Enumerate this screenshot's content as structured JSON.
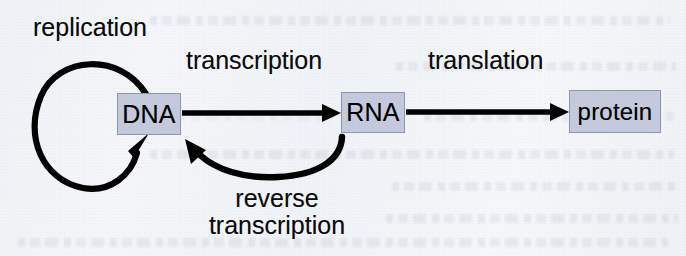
{
  "figure": {
    "background_color": "#f2f4f7",
    "node_fill_color": "#c4cadb",
    "node_border_color": "#8e96ad",
    "arrow_color": "#000000",
    "text_color": "#0a0a0a"
  },
  "nodes": [
    {
      "id": "dna",
      "label": "DNA"
    },
    {
      "id": "rna",
      "label": "RNA"
    },
    {
      "id": "protein",
      "label": "protein"
    }
  ],
  "labels": {
    "replication": "replication",
    "transcription": "transcription",
    "translation": "translation",
    "reverse_transcription_line1": "reverse",
    "reverse_transcription_line2": "transcription"
  },
  "edges": [
    {
      "id": "replication",
      "from": "DNA",
      "to": "DNA",
      "label": "replication",
      "shape": "loop-left-ellipse"
    },
    {
      "id": "transcription",
      "from": "DNA",
      "to": "RNA",
      "label": "transcription",
      "shape": "straight-right"
    },
    {
      "id": "translation",
      "from": "RNA",
      "to": "protein",
      "label": "translation",
      "shape": "straight-right"
    },
    {
      "id": "reverse-transcription",
      "from": "RNA",
      "to": "DNA",
      "label": "reverse transcription",
      "shape": "curve-below-leftward"
    }
  ]
}
